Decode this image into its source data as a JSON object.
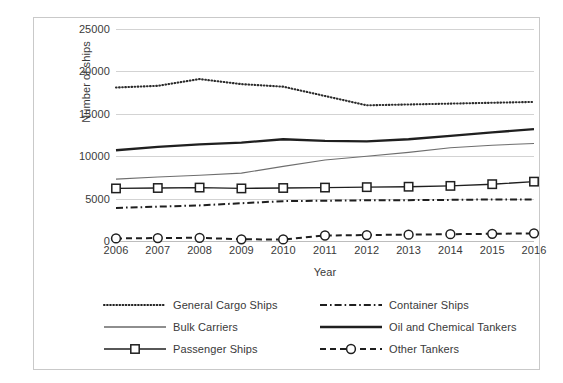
{
  "chart_data": {
    "type": "line",
    "title": "",
    "xlabel": "Year",
    "ylabel": "Number of ships",
    "categories": [
      "2006",
      "2007",
      "2008",
      "2009",
      "2010",
      "2011",
      "2012",
      "2013",
      "2014",
      "2015",
      "2016"
    ],
    "x": [
      2006,
      2007,
      2008,
      2009,
      2010,
      2011,
      2012,
      2013,
      2014,
      2015,
      2016
    ],
    "ylim": [
      0,
      25000
    ],
    "y_ticks": [
      0,
      5000,
      10000,
      15000,
      20000,
      25000
    ],
    "y_tick_labels": [
      "0",
      "5000",
      "10000",
      "15000",
      "20000",
      "25000"
    ],
    "grid": true,
    "legend_position": "bottom",
    "legend_columns": 2,
    "series": [
      {
        "name": "General Cargo Ships",
        "style": "dotted",
        "marker": "none",
        "color": "#2b2b2b",
        "values": [
          18100,
          18300,
          19100,
          18500,
          18200,
          17100,
          16000,
          16100,
          16200,
          16300,
          16400
        ]
      },
      {
        "name": "Container Ships",
        "style": "dash-dot",
        "marker": "none",
        "color": "#1f1f1f",
        "values": [
          3900,
          4050,
          4200,
          4450,
          4700,
          4750,
          4800,
          4820,
          4850,
          4900,
          4900
        ]
      },
      {
        "name": "Bulk Carriers",
        "style": "solid-thin",
        "marker": "none",
        "color": "#6e6e6e",
        "values": [
          7300,
          7550,
          7750,
          8000,
          8800,
          9550,
          10000,
          10450,
          11000,
          11300,
          11500
        ]
      },
      {
        "name": "Oil and Chemical Tankers",
        "style": "solid-thick",
        "marker": "none",
        "color": "#1f1f1f",
        "values": [
          10700,
          11100,
          11400,
          11600,
          12000,
          11800,
          11750,
          12000,
          12400,
          12800,
          13200
        ]
      },
      {
        "name": "Passenger Ships",
        "style": "solid-marker",
        "marker": "square",
        "color": "#1f1f1f",
        "values": [
          6200,
          6250,
          6300,
          6200,
          6250,
          6300,
          6350,
          6400,
          6500,
          6700,
          7000
        ]
      },
      {
        "name": "Other Tankers",
        "style": "dashed-marker",
        "marker": "circle",
        "color": "#1f1f1f",
        "values": [
          300,
          350,
          380,
          200,
          180,
          650,
          700,
          750,
          800,
          850,
          900
        ]
      }
    ]
  },
  "axes": {
    "y_title": "Number of ships",
    "x_title": "Year"
  },
  "legend": {
    "items": [
      {
        "label": "General Cargo Ships",
        "style": "dotted",
        "marker": "none",
        "column": "left",
        "row": 0
      },
      {
        "label": "Container Ships",
        "style": "dash-dot",
        "marker": "none",
        "column": "right",
        "row": 0
      },
      {
        "label": "Bulk Carriers",
        "style": "solid-thin",
        "marker": "none",
        "column": "left",
        "row": 1
      },
      {
        "label": "Oil and Chemical Tankers",
        "style": "solid-thick",
        "marker": "none",
        "column": "right",
        "row": 1
      },
      {
        "label": "Passenger Ships",
        "style": "solid-marker",
        "marker": "square",
        "column": "left",
        "row": 2
      },
      {
        "label": "Other Tankers",
        "style": "dashed-marker",
        "marker": "circle",
        "column": "right",
        "row": 2
      }
    ]
  },
  "colors": {
    "grid": "#d3d3d3",
    "text": "#3a3a3a",
    "frame": "#c9c9c9",
    "plot_background": "#ffffff"
  }
}
